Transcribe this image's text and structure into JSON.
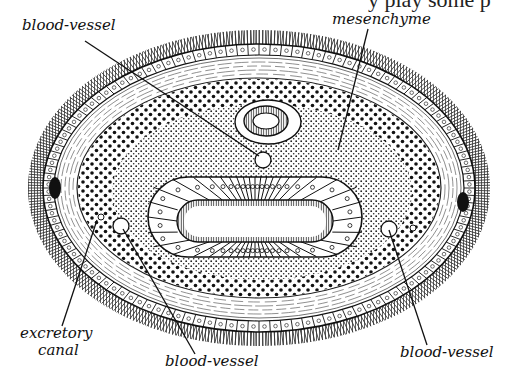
{
  "figure": {
    "type": "cross-section diagram",
    "cut_off_text_top": "y play some p"
  },
  "labels": {
    "blood_vessel_top": "blood-vessel",
    "mesenchyme": "mesenchyme",
    "excretory_canal_line1": "excretory",
    "excretory_canal_line2": "canal",
    "blood_vessel_bottom_left": "blood-vessel",
    "blood_vessel_bottom_right": "blood-vessel"
  },
  "structures": [
    {
      "name": "ciliated epidermis",
      "labeled": false
    },
    {
      "name": "muscle layers",
      "labeled": false
    },
    {
      "name": "mesenchyme",
      "labeled": true
    },
    {
      "name": "nerve cord / rhynchocoel",
      "labeled": false
    },
    {
      "name": "gut (intestine) with lumen",
      "labeled": false
    },
    {
      "name": "lateral nerve cords",
      "labeled": false
    },
    {
      "name": "blood-vessel (dorsal)",
      "labeled": true
    },
    {
      "name": "blood-vessel (lateral, left)",
      "labeled": true
    },
    {
      "name": "blood-vessel (lateral, right)",
      "labeled": true
    },
    {
      "name": "excretory canal",
      "labeled": true
    }
  ],
  "colors": {
    "ink": "#111111",
    "paper": "#ffffff"
  }
}
